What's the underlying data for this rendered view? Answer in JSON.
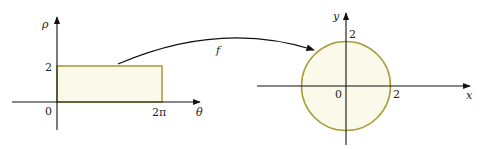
{
  "left_plot": {
    "vertical_axis_label": "ρ",
    "horizontal_axis_label": "θ",
    "origin_label": "0",
    "y_tick_label": "2",
    "x_tick_label": "2π",
    "region": "rectangle",
    "region_fill": "#fbfaea",
    "region_stroke": "#a8a040"
  },
  "mapping": {
    "label": "f"
  },
  "right_plot": {
    "vertical_axis_label": "y",
    "horizontal_axis_label": "x",
    "origin_label": "0",
    "y_tick_label": "2",
    "x_tick_label": "2",
    "region": "disk",
    "region_fill": "#fbfaea",
    "region_stroke": "#a8a040"
  }
}
